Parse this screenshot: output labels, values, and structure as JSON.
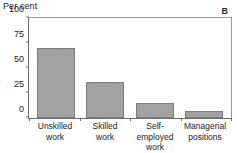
{
  "panel": {
    "label": "B"
  },
  "chart_data": {
    "type": "bar",
    "title": "",
    "subtitle": "",
    "xlabel": "",
    "ylabel": "Per cent",
    "ylim": [
      0,
      100
    ],
    "yticks": [
      0,
      25,
      50,
      75,
      100
    ],
    "ytick_labels": [
      "0",
      "25",
      "50",
      "75",
      "100"
    ],
    "grid": false,
    "legend": false,
    "legend_position": "none",
    "annotations": [
      "B"
    ],
    "categories": [
      "Unskilled work",
      "Skilled work",
      "Self-employed work",
      "Managerial positions"
    ],
    "category_lines": [
      [
        "Unskilled",
        "work"
      ],
      [
        "Skilled",
        "work"
      ],
      [
        "Self-employed",
        "work"
      ],
      [
        "Managerial",
        "positions"
      ]
    ],
    "values": [
      70,
      36,
      15,
      7
    ],
    "bar_color": "#a6a6a6",
    "bar_edge_color": "#7d7d7d"
  }
}
